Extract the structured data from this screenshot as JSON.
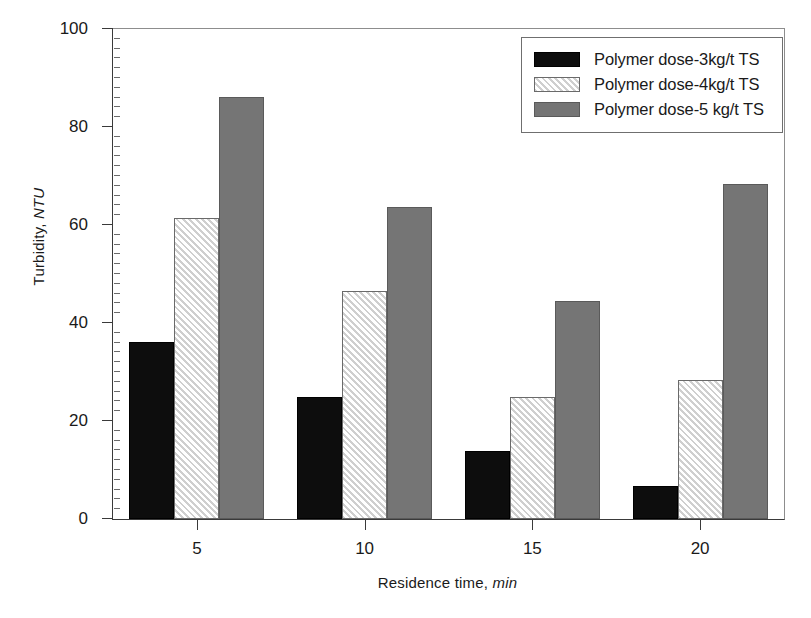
{
  "chart_data": {
    "type": "bar",
    "title": "",
    "xlabel": "Residence time, min",
    "xlabel_plain": "Residence time,",
    "xlabel_italic": "min",
    "ylabel": "Turbidity, NTU",
    "ylabel_plain": "Turbidity,",
    "ylabel_italic": "NTU",
    "categories": [
      "5",
      "10",
      "15",
      "20"
    ],
    "ylim": [
      0,
      100
    ],
    "ytick_values": [
      0,
      20,
      40,
      60,
      80,
      100
    ],
    "ytick_labels": [
      "0",
      "20",
      "40",
      "60",
      "80",
      "100"
    ],
    "y_minor_step": 2,
    "grid": false,
    "legend_position": "top-right",
    "series": [
      {
        "name": "Polymer dose-3kg/t TS",
        "color": "#0d0d0d",
        "fill": "solid",
        "values": [
          36.2,
          24.8,
          13.8,
          6.8
        ]
      },
      {
        "name": "Polymer dose-4kg/t TS",
        "color": "#cfcfcf",
        "fill": "diagonal-hatch",
        "values": [
          61.4,
          46.6,
          25.0,
          28.4
        ]
      },
      {
        "name": "Polymer dose-5 kg/t TS",
        "color": "#757575",
        "fill": "solid",
        "values": [
          86.2,
          63.6,
          44.4,
          68.4
        ]
      }
    ]
  },
  "legend": {
    "items": [
      "Polymer dose-3kg/t TS",
      "Polymer dose-4kg/t TS",
      "Polymer dose-5 kg/t TS"
    ]
  }
}
